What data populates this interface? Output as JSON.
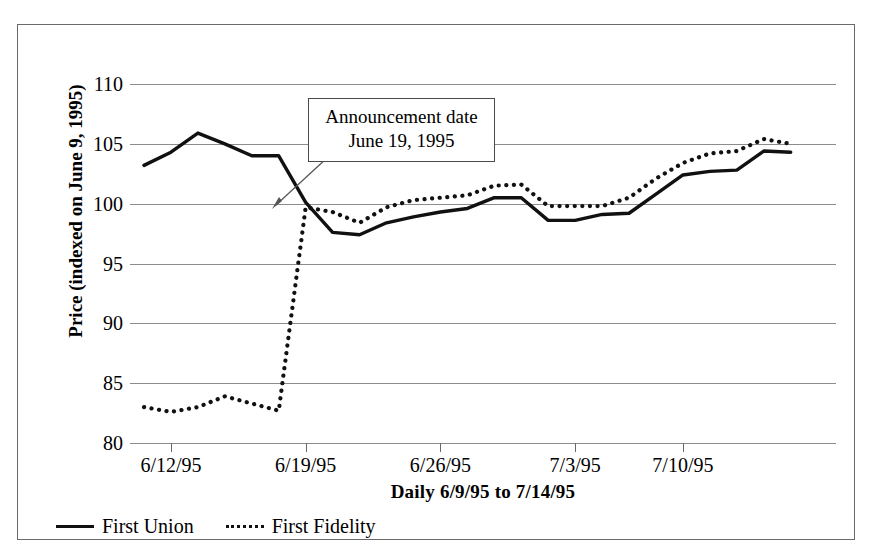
{
  "chart_data": {
    "type": "line",
    "title": "",
    "xlabel": "Daily 6/9/95 to 7/14/95",
    "ylabel": "Price (indexed on June 9, 1995)",
    "ylim": [
      80,
      110
    ],
    "yticks": [
      80,
      85,
      90,
      95,
      100,
      105,
      110
    ],
    "ytick_labels": [
      "80",
      "85",
      "90",
      "95",
      "100",
      "105",
      "110"
    ],
    "grid": true,
    "legend_position": "bottom-left",
    "x": [
      "6/9/95",
      "6/12/95",
      "6/13/95",
      "6/14/95",
      "6/15/95",
      "6/16/95",
      "6/19/95",
      "6/20/95",
      "6/21/95",
      "6/22/95",
      "6/23/95",
      "6/26/95",
      "6/27/95",
      "6/28/95",
      "6/29/95",
      "6/30/95",
      "7/3/95",
      "7/5/95",
      "7/6/95",
      "7/7/95",
      "7/10/95",
      "7/11/95",
      "7/12/95",
      "7/13/95",
      "7/14/95"
    ],
    "xtick_labels": [
      "6/12/95",
      "6/19/95",
      "6/26/95",
      "7/3/95",
      "7/10/95"
    ],
    "xtick_indices": [
      1,
      6,
      11,
      16,
      20
    ],
    "series": [
      {
        "name": "First Union",
        "style": "solid",
        "color": "#111111",
        "values": [
          103.2,
          104.3,
          105.9,
          105.0,
          104.0,
          104.0,
          100.1,
          97.6,
          97.4,
          98.4,
          98.9,
          99.3,
          99.6,
          100.5,
          100.5,
          98.6,
          98.6,
          99.1,
          99.2,
          100.8,
          102.4,
          102.7,
          102.8,
          104.4,
          104.3
        ]
      },
      {
        "name": "First Fidelity",
        "style": "dotted",
        "color": "#111111",
        "values": [
          83.0,
          82.6,
          83.0,
          83.9,
          83.3,
          82.7,
          99.7,
          99.3,
          98.4,
          99.7,
          100.3,
          100.5,
          100.7,
          101.5,
          101.6,
          99.8,
          99.8,
          99.8,
          100.5,
          102.1,
          103.4,
          104.2,
          104.4,
          105.4,
          105.0
        ]
      }
    ],
    "annotations": [
      {
        "name": "announcement-callout",
        "line1": "Announcement date",
        "line2": "June 19, 1995",
        "points_to_x": "6/19/95",
        "points_to_y": 100
      }
    ]
  },
  "legend": {
    "items": [
      {
        "label": "First Union",
        "style": "solid"
      },
      {
        "label": "First Fidelity",
        "style": "dotted"
      }
    ]
  }
}
